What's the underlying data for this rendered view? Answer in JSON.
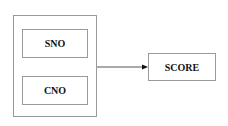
{
  "diagram": {
    "group": {
      "members": [
        "SNO",
        "CNO"
      ]
    },
    "target": "SCORE",
    "edges": [
      {
        "from": "group",
        "to": "SCORE"
      }
    ]
  }
}
